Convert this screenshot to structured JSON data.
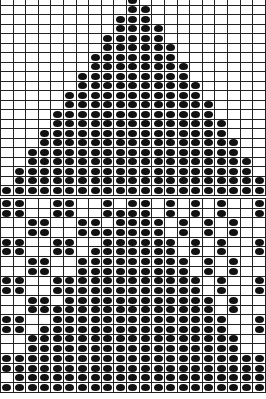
{
  "charts": [
    {
      "id": "top-chart",
      "name": "triangle-pattern-chart",
      "columns": 21,
      "row_height": 9.5,
      "fill_color": "#111111",
      "grid_color": "#222222",
      "rows": [
        [
          10,
          10
        ],
        [
          10,
          11
        ],
        [
          9,
          11
        ],
        [
          9,
          12
        ],
        [
          8,
          12
        ],
        [
          8,
          13
        ],
        [
          7,
          13
        ],
        [
          7,
          14
        ],
        [
          6,
          14
        ],
        [
          6,
          15
        ],
        [
          5,
          15
        ],
        [
          5,
          16
        ],
        [
          4,
          16
        ],
        [
          4,
          17
        ],
        [
          3,
          17
        ],
        [
          3,
          18
        ],
        [
          2,
          18
        ],
        [
          2,
          19
        ],
        [
          1,
          19
        ],
        [
          1,
          20
        ],
        [
          0,
          20
        ]
      ],
      "row_format": "range [first_filled_col, last_filled_col]"
    },
    {
      "id": "bottom-chart",
      "name": "mosaic-pattern-chart",
      "columns": 21,
      "row_height": 9.7,
      "fill_color": "#111111",
      "grid_color": "#222222",
      "row_format": "list of filled column indices",
      "rows": [
        [
          0,
          1,
          4,
          5,
          8,
          10,
          11,
          13,
          15,
          17,
          20
        ],
        [
          0,
          1,
          4,
          5,
          8,
          9,
          10,
          11,
          13,
          15,
          17,
          20
        ],
        [
          2,
          3,
          6,
          7,
          9,
          10,
          11,
          12,
          14,
          16,
          18
        ],
        [
          2,
          3,
          6,
          7,
          8,
          9,
          10,
          11,
          12,
          14,
          16,
          18
        ],
        [
          0,
          1,
          4,
          5,
          8,
          9,
          10,
          11,
          12,
          13,
          15,
          17,
          20
        ],
        [
          0,
          1,
          4,
          5,
          7,
          8,
          9,
          10,
          11,
          12,
          13,
          15,
          17,
          20
        ],
        [
          2,
          3,
          6,
          7,
          8,
          9,
          10,
          11,
          12,
          13,
          14,
          16,
          18
        ],
        [
          2,
          3,
          6,
          7,
          8,
          9,
          10,
          11,
          12,
          13,
          14,
          16,
          18
        ],
        [
          0,
          1,
          4,
          5,
          6,
          7,
          8,
          9,
          10,
          11,
          12,
          13,
          14,
          15,
          17,
          20
        ],
        [
          0,
          1,
          4,
          5,
          6,
          7,
          8,
          9,
          10,
          11,
          12,
          13,
          14,
          15,
          17,
          20
        ],
        [
          2,
          3,
          5,
          6,
          7,
          8,
          9,
          10,
          11,
          12,
          13,
          14,
          15,
          16,
          18
        ],
        [
          2,
          3,
          4,
          5,
          6,
          7,
          8,
          9,
          10,
          11,
          12,
          13,
          14,
          15,
          16,
          18
        ],
        [
          0,
          1,
          4,
          5,
          6,
          7,
          8,
          9,
          10,
          11,
          12,
          13,
          14,
          15,
          16,
          17,
          20
        ],
        [
          0,
          1,
          3,
          4,
          5,
          6,
          7,
          8,
          9,
          10,
          11,
          12,
          13,
          14,
          15,
          16,
          17,
          20
        ],
        [
          2,
          3,
          4,
          5,
          6,
          7,
          8,
          9,
          10,
          11,
          12,
          13,
          14,
          15,
          16,
          17,
          18
        ],
        [
          2,
          3,
          4,
          5,
          6,
          7,
          8,
          9,
          10,
          11,
          12,
          13,
          14,
          15,
          16,
          17,
          18
        ],
        [
          0,
          1,
          2,
          3,
          4,
          5,
          6,
          7,
          8,
          9,
          10,
          11,
          12,
          13,
          14,
          15,
          16,
          17,
          18,
          19,
          20
        ],
        [
          0,
          1,
          2,
          3,
          4,
          5,
          6,
          7,
          8,
          9,
          10,
          11,
          12,
          13,
          14,
          15,
          16,
          17,
          18,
          19,
          20
        ],
        [
          1,
          2,
          3,
          4,
          5,
          6,
          7,
          8,
          9,
          10,
          11,
          12,
          13,
          14,
          15,
          16,
          17,
          18,
          19,
          20
        ],
        [
          0,
          1,
          2,
          3,
          4,
          5,
          6,
          7,
          8,
          9,
          10,
          11,
          12,
          13,
          14,
          15,
          16,
          17,
          18,
          19,
          20
        ]
      ]
    }
  ]
}
